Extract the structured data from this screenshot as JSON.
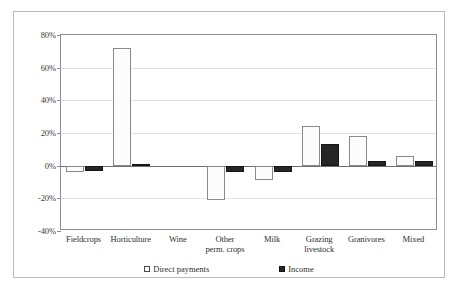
{
  "chart_data": {
    "type": "bar",
    "title": "",
    "subtitle": "",
    "xlabel": "",
    "ylabel": "",
    "categories": [
      "Fieldcrops",
      "Horticulture",
      "Wine",
      "Other perm. crops",
      "Milk",
      "Grazing livestock",
      "Granivores",
      "Mixed"
    ],
    "category_lines": [
      [
        "Fieldcrops"
      ],
      [
        "Horticulture"
      ],
      [
        "Wine"
      ],
      [
        "Other",
        "perm. crops"
      ],
      [
        "Milk"
      ],
      [
        "Grazing",
        "livestock"
      ],
      [
        "Granivores"
      ],
      [
        "Mixed"
      ]
    ],
    "series": [
      {
        "name": "Direct payments",
        "color": "#ffffff",
        "values": [
          -4,
          72,
          0,
          -21,
          -9,
          24,
          18,
          6
        ]
      },
      {
        "name": "Income",
        "color": "#262626",
        "values": [
          -3,
          1,
          0,
          -4,
          -4,
          13,
          3,
          3
        ]
      }
    ],
    "ylim": [
      -40,
      80
    ],
    "yticks": [
      80,
      60,
      40,
      20,
      0,
      -20,
      -40
    ],
    "ytick_labels": [
      "80%",
      "60%",
      "40%",
      "20%",
      "0%",
      "-20%",
      "-40%"
    ],
    "grid": true,
    "legend_position": "bottom",
    "value_suffix": "%"
  },
  "legend": {
    "items": [
      {
        "label": "Direct payments",
        "swatch": "hollow-square-icon"
      },
      {
        "label": "Income",
        "swatch": "filled-square-icon"
      }
    ]
  }
}
